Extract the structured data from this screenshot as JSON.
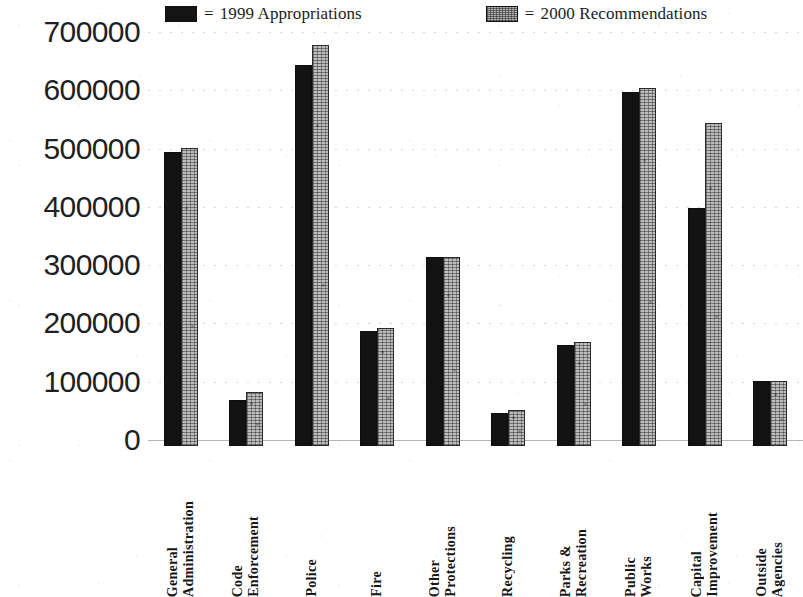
{
  "legend": {
    "entries": [
      {
        "equals": "=",
        "label": "1999 Appropriations",
        "swatch": "dark-solid-swatch"
      },
      {
        "equals": "=",
        "label": "2000 Recommendations",
        "swatch": "light-textured-swatch"
      }
    ]
  },
  "y_axis": {
    "ticks": [
      "700000",
      "600000",
      "500000",
      "400000",
      "300000",
      "200000",
      "100000",
      "0"
    ]
  },
  "x_axis": {
    "labels": [
      "General\nAdministration",
      "Code\nEnforcement",
      "Police",
      "Fire",
      "Other\nProtections",
      "Recycling",
      "Parks &\nRecreation",
      "Public\nWorks",
      "Capital\nImprovement",
      "Outside\nAgencies"
    ]
  },
  "colors": {
    "series_1999": "#131313",
    "series_2000": "#bdbdbd",
    "axis_text": "#1f1f1f",
    "background": "#ffffff"
  },
  "chart_data": {
    "type": "bar",
    "title": "",
    "xlabel": "",
    "ylabel": "",
    "ylim": [
      0,
      700000
    ],
    "ytick_step": 100000,
    "grid": true,
    "legend_position": "top",
    "categories": [
      "General Administration",
      "Code Enforcement",
      "Police",
      "Fire",
      "Other Protections",
      "Recycling",
      "Parks & Recreation",
      "Public Works",
      "Capital Improvement",
      "Outside Agencies"
    ],
    "series": [
      {
        "name": "1999 Appropriations",
        "values": [
          505000,
          79000,
          654000,
          198000,
          325000,
          57000,
          174000,
          607000,
          408000,
          112000
        ]
      },
      {
        "name": "2000 Recommendations",
        "values": [
          512000,
          93000,
          688000,
          202000,
          325000,
          62000,
          179000,
          614000,
          554000,
          112000
        ]
      }
    ]
  }
}
